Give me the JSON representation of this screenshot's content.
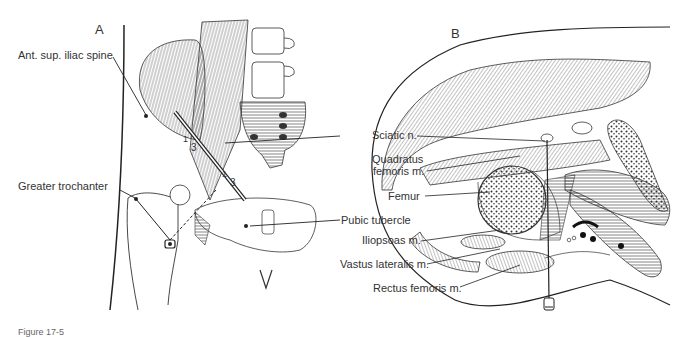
{
  "panels": {
    "a": {
      "letter": "A",
      "labels": {
        "asis": "Ant. sup. iliac spine",
        "gt": "Greater trochanter",
        "frac1a": "1",
        "frac1b": "3",
        "frac2a": "1",
        "frac2b": "3"
      }
    },
    "b": {
      "letter": "B",
      "labels": {
        "sciatic": "Sciatic n.",
        "quadratus1": "Quadratus",
        "quadratus2": "femoris m.",
        "femur": "Femur",
        "pubic": "Pubic tubercle",
        "iliopsoas": "Iliopsoas m.",
        "vastus": "Vastus lateralis m.",
        "rectus": "Rectus femoris m."
      }
    }
  },
  "caption": "Figure 17-5"
}
